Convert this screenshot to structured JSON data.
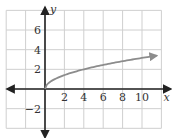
{
  "chart_data": {
    "type": "line",
    "title": "",
    "xlabel": "x",
    "ylabel": "y",
    "xlim": [
      -4,
      12
    ],
    "ylim": [
      -4,
      8
    ],
    "grid": true,
    "x_ticks": [
      2,
      4,
      6,
      8,
      10
    ],
    "y_ticks": [
      6,
      4,
      2,
      -2
    ],
    "x_tick_labels": [
      "2",
      "4",
      "6",
      "8",
      "10"
    ],
    "y_tick_labels": [
      "6",
      "4",
      "2",
      "−2"
    ],
    "series": [
      {
        "name": "y = √x",
        "function": "sqrt(x)",
        "x": [
          0,
          1,
          2,
          4,
          6,
          8,
          10,
          11.5
        ],
        "values": [
          0,
          1,
          1.41,
          2,
          2.45,
          2.83,
          3.16,
          3.39
        ],
        "color": "#8c8c8c",
        "arrow_end": true
      }
    ],
    "colors": {
      "grid": "#cfcfcf",
      "axes": "#222222",
      "curve": "#8c8c8c"
    }
  }
}
